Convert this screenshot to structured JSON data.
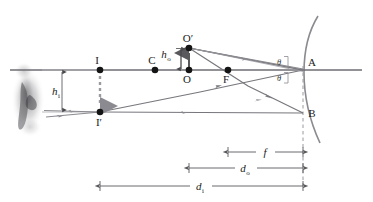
{
  "figure": {
    "type": "ray-diagram",
    "width": 373,
    "height": 202,
    "background": "#ffffff"
  },
  "colors": {
    "axis": "#6e6e73",
    "ray": "#77777d",
    "mirror": "#8a8a90",
    "dimension": "#5a5a5e",
    "guide": "#b4b4b8",
    "point": "#141414",
    "dashed": "#9a9aa0",
    "text": "#1a1a1a",
    "smudge": "#8c8c90"
  },
  "geometry": {
    "axis_y": 70,
    "axis_x_start": 10,
    "axis_x_end": 362,
    "vertex_x": 303,
    "mirror_center_x": 155,
    "focal_x": 228,
    "object_x": 189,
    "object_top_y": 48,
    "image_x": 100,
    "image_bottom_y": 112,
    "b_y": 113
  },
  "points": [
    {
      "id": "I",
      "label": "I",
      "x": 100,
      "y": 70,
      "label_dx": -1,
      "label_dy": -7,
      "desc": "image-point-on-axis"
    },
    {
      "id": "Ip",
      "label": "I′",
      "x": 100,
      "y": 112,
      "label_dx": -2,
      "label_dy": 13,
      "desc": "image-point-tip"
    },
    {
      "id": "C",
      "label": "C",
      "x": 155,
      "y": 70,
      "label_dx": -3,
      "label_dy": -7,
      "desc": "center-of-curvature"
    },
    {
      "id": "O",
      "label": "O",
      "x": 189,
      "y": 70,
      "label_dx": -3,
      "label_dy": 13,
      "desc": "object-base-on-axis"
    },
    {
      "id": "Op",
      "label": "O′",
      "x": 189,
      "y": 48,
      "label_dx": -3,
      "label_dy": -7,
      "desc": "object-tip"
    },
    {
      "id": "F",
      "label": "F",
      "x": 228,
      "y": 70,
      "label_dx": -3,
      "label_dy": 13,
      "desc": "focal-point"
    },
    {
      "id": "A",
      "label": "A",
      "x": 303,
      "y": 70,
      "label_dx": 6,
      "label_dy": -4,
      "desc": "mirror-vertex"
    },
    {
      "id": "B",
      "label": "B",
      "x": 303,
      "y": 113,
      "label_dx": 6,
      "label_dy": 4,
      "desc": "mirror-lower-reflection-point"
    }
  ],
  "height_labels": {
    "object_height": {
      "symbol": "h",
      "subscript": "o",
      "x": 168,
      "y": 56,
      "desc": "object-height"
    },
    "image_height": {
      "symbol": "h",
      "subscript": "i",
      "x": 60,
      "y": 95,
      "desc": "image-height"
    }
  },
  "angle_labels": [
    {
      "symbol": "θ",
      "x": 278,
      "y": 62,
      "desc": "incident-angle"
    },
    {
      "symbol": "θ",
      "x": 278,
      "y": 78,
      "desc": "reflected-angle"
    }
  ],
  "dimensions": [
    {
      "id": "f",
      "symbol": "f",
      "subscript": "",
      "x1": 228,
      "x2": 303,
      "y": 152,
      "label_x": 265,
      "label_y": 149,
      "desc": "focal-length"
    },
    {
      "id": "do",
      "symbol": "d",
      "subscript": "o",
      "x1": 189,
      "x2": 303,
      "y": 168,
      "label_x": 245,
      "label_y": 165,
      "desc": "object-distance"
    },
    {
      "id": "di",
      "symbol": "d",
      "subscript": "i",
      "x1": 100,
      "x2": 303,
      "y": 186,
      "label_x": 200,
      "label_y": 183,
      "desc": "image-distance"
    }
  ],
  "rays": [
    {
      "id": "ray-Op-to-A",
      "desc": "ray-from-object-tip-to-mirror-vertex"
    },
    {
      "id": "ray-A-to-Ip",
      "desc": "reflected-ray-vertex-to-image-tip"
    },
    {
      "id": "ray-Op-to-B",
      "desc": "ray-from-object-tip-through-focus-to-B"
    },
    {
      "id": "ray-B-to-Ip",
      "desc": "reflected-ray-B-to-image-tip-horizontal"
    },
    {
      "id": "ray-Op-parallel",
      "desc": "parallel-ray-from-object-tip-to-mirror"
    },
    {
      "id": "ray-extend-left-1",
      "desc": "virtual-ray-extension-left-upper"
    },
    {
      "id": "ray-extend-left-2",
      "desc": "virtual-ray-extension-left-lower"
    }
  ],
  "annotations": {
    "mirror": "concave-mirror-arc",
    "optical_axis": "principal-axis",
    "dashed_vertical": "mirror-plane-dashed-line",
    "dashed_image_arrow": "inverted-image-arrow-dashed",
    "object_arrow": "upright-object-arrow",
    "observer_smudge": "observer-eye-smudge"
  }
}
